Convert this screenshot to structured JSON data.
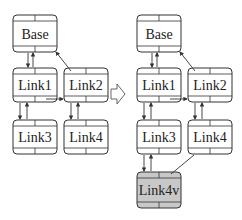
{
  "diagram": {
    "before": {
      "nodes": [
        {
          "id": "base",
          "label": "Base",
          "x": 13,
          "y": 15,
          "w": 44,
          "h": 37,
          "fill": "#ffffff"
        },
        {
          "id": "link1",
          "label": "Link1",
          "x": 13,
          "y": 68,
          "w": 44,
          "h": 34,
          "fill": "#ffffff"
        },
        {
          "id": "link2",
          "label": "Link2",
          "x": 64,
          "y": 68,
          "w": 44,
          "h": 34,
          "fill": "#ffffff"
        },
        {
          "id": "link3",
          "label": "Link3",
          "x": 13,
          "y": 120,
          "w": 44,
          "h": 34,
          "fill": "#ffffff"
        },
        {
          "id": "link4",
          "label": "Link4",
          "x": 64,
          "y": 120,
          "w": 44,
          "h": 34,
          "fill": "#ffffff"
        }
      ]
    },
    "after": {
      "nodes": [
        {
          "id": "base",
          "label": "Base",
          "x": 137,
          "y": 15,
          "w": 44,
          "h": 37,
          "fill": "#ffffff"
        },
        {
          "id": "link1",
          "label": "Link1",
          "x": 137,
          "y": 68,
          "w": 44,
          "h": 34,
          "fill": "#ffffff"
        },
        {
          "id": "link2",
          "label": "Link2",
          "x": 188,
          "y": 68,
          "w": 44,
          "h": 34,
          "fill": "#ffffff"
        },
        {
          "id": "link3",
          "label": "Link3",
          "x": 137,
          "y": 120,
          "w": 44,
          "h": 34,
          "fill": "#ffffff"
        },
        {
          "id": "link4",
          "label": "Link4",
          "x": 188,
          "y": 120,
          "w": 44,
          "h": 34,
          "fill": "#ffffff"
        },
        {
          "id": "link4v",
          "label": "Link4v",
          "x": 137,
          "y": 172,
          "w": 44,
          "h": 36,
          "fill": "#c8c8c8"
        }
      ]
    },
    "transform_arrow": "hollow-right-arrow",
    "colors": {
      "stroke": "#333333",
      "virtual_fill": "#c8c8c8"
    }
  }
}
